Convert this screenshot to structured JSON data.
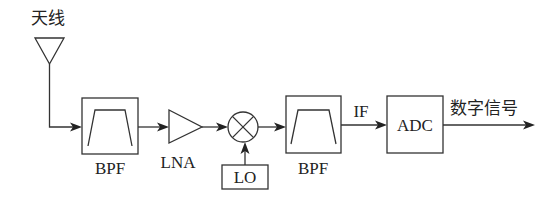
{
  "diagram": {
    "type": "receiver-block-diagram",
    "colors": {
      "line": "#333333",
      "text": "#222222",
      "background": "#ffffff"
    },
    "antenna": {
      "label": "天线"
    },
    "blocks": [
      {
        "id": "bpf1",
        "label": "BPF",
        "kind": "bandpass-filter"
      },
      {
        "id": "lna",
        "label": "LNA",
        "kind": "amplifier"
      },
      {
        "id": "mixer",
        "label": "",
        "kind": "mixer"
      },
      {
        "id": "lo",
        "label": "LO",
        "kind": "local-oscillator"
      },
      {
        "id": "bpf2",
        "label": "BPF",
        "kind": "bandpass-filter"
      },
      {
        "id": "adc",
        "label": "ADC",
        "kind": "converter"
      }
    ],
    "signals": {
      "if_label": "IF",
      "output_label": "数字信号"
    },
    "connections": [
      [
        "antenna",
        "bpf1"
      ],
      [
        "bpf1",
        "lna"
      ],
      [
        "lna",
        "mixer"
      ],
      [
        "lo",
        "mixer"
      ],
      [
        "mixer",
        "bpf2"
      ],
      [
        "bpf2",
        "adc"
      ],
      [
        "adc",
        "output"
      ]
    ]
  }
}
